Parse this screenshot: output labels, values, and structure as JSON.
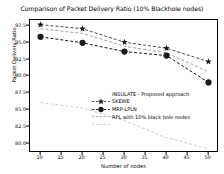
{
  "chart_data": {
    "type": "line",
    "title": "Comparison of Packet Delivery Ratio (10% Blackhole nodes)",
    "xlabel": "Number of nodes",
    "ylabel": "Packet Delivery Ratio",
    "x": [
      10,
      20,
      30,
      40,
      50
    ],
    "xlim": [
      7.5,
      52.5
    ],
    "ylim": [
      78.6,
      98.4
    ],
    "xticks": [
      10,
      15,
      20,
      25,
      30,
      35,
      40,
      45,
      50
    ],
    "yticks": [
      80.0,
      82.5,
      85.0,
      87.5,
      90.0,
      92.5,
      95.0,
      97.5
    ],
    "ytick_labels": [
      "80.0",
      "82.5",
      "85.0",
      "87.5",
      "90.0",
      "92.5",
      "95.0",
      "97.5"
    ],
    "xtick_labels": [
      "10",
      "15",
      "20",
      "25",
      "30",
      "35",
      "40",
      "45",
      "50"
    ],
    "grid": false,
    "legend_position": "center",
    "series": [
      {
        "name": "INSULATE - Proposed approach",
        "marker": "star",
        "linestyle": "dashed",
        "color": "#1a1a1a",
        "values": [
          97.7,
          97.1,
          95.1,
          94.2,
          92.2
        ]
      },
      {
        "name": "SKEWE",
        "marker": "circle",
        "linestyle": "dashed",
        "color": "#1a1a1a",
        "values": [
          95.9,
          95.0,
          93.7,
          93.1,
          89.1
        ]
      },
      {
        "name": "MRP-LPLN",
        "marker": "none",
        "linestyle": "dashed",
        "color": "#8c8c8c",
        "values": [
          97.1,
          96.4,
          94.5,
          93.5,
          90.7
        ]
      },
      {
        "name": "RPL with 10% black hole nodes",
        "marker": "none",
        "linestyle": "dashed",
        "color": "#bfbfbf",
        "values": [
          86.1,
          85.3,
          83.4,
          80.9,
          79.2
        ]
      }
    ]
  }
}
